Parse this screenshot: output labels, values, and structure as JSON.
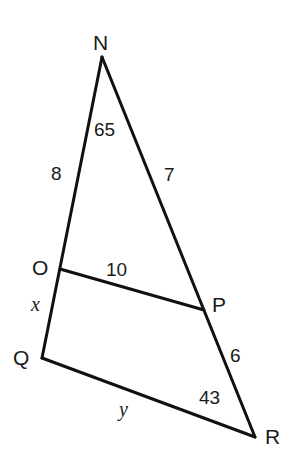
{
  "diagram": {
    "type": "geometry-triangle",
    "stroke_color": "#111111",
    "background": "#ffffff",
    "vertices": {
      "N": {
        "label": "N",
        "x": 102,
        "y": 57
      },
      "O": {
        "label": "O",
        "x": 60,
        "y": 269
      },
      "P": {
        "label": "P",
        "x": 204,
        "y": 310
      },
      "Q": {
        "label": "Q",
        "x": 42,
        "y": 358
      },
      "R": {
        "label": "R",
        "x": 255,
        "y": 437
      }
    },
    "segments": [
      {
        "from": "N",
        "to": "Q"
      },
      {
        "from": "N",
        "to": "R"
      },
      {
        "from": "O",
        "to": "P"
      },
      {
        "from": "Q",
        "to": "R"
      }
    ],
    "measures": {
      "NO": "8",
      "NP": "7",
      "OP": "10",
      "PR": "6",
      "OQ": "x",
      "QR": "y",
      "angle_N": "65",
      "angle_R": "43"
    }
  }
}
